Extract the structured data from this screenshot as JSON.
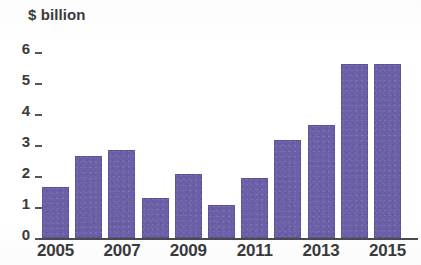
{
  "chart_data": {
    "type": "bar",
    "title": "",
    "ylabel": "$ billion",
    "xlabel": "",
    "categories": [
      "2005",
      "2006",
      "2007",
      "2008",
      "2009",
      "2010",
      "2011",
      "2012",
      "2013",
      "2014",
      "2015"
    ],
    "values": [
      1.65,
      2.65,
      2.85,
      1.3,
      2.05,
      1.05,
      1.95,
      3.15,
      3.65,
      5.6,
      5.6
    ],
    "x_tick_labels": [
      "2005",
      "2007",
      "2009",
      "2011",
      "2013",
      "2015"
    ],
    "x_tick_categories": [
      "2005",
      "2007",
      "2009",
      "2011",
      "2013",
      "2015"
    ],
    "y_tick_labels": [
      "0",
      "1",
      "2",
      "3",
      "4",
      "5",
      "6"
    ],
    "y_tick_values": [
      0,
      1,
      2,
      3,
      4,
      5,
      6
    ],
    "ylim": [
      0,
      6
    ],
    "grid": false,
    "legend": null,
    "bar_color": "#6b5fa8",
    "axis_color": "#4a4a50",
    "text_color": "#3a3a3c"
  },
  "axis": {
    "y_title": "$ billion"
  }
}
